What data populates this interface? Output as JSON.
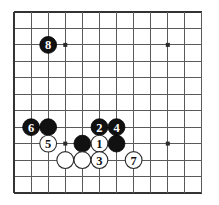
{
  "board": {
    "title": "Go board diagram",
    "background_color": "#ffffff",
    "line_color": "#5a5a5a",
    "edge_color": "#333333",
    "black_color": "#111111",
    "white_color": "#ffffff",
    "columns": 12,
    "rows": 12,
    "origin_x": 14,
    "origin_y": 12,
    "spacing_x": 17.09,
    "spacing_y": 16.45,
    "star_points": [
      {
        "col": 3,
        "row": 2
      },
      {
        "col": 9,
        "row": 2
      },
      {
        "col": 3,
        "row": 8
      },
      {
        "col": 9,
        "row": 8
      }
    ],
    "stones": [
      {
        "col": 2,
        "row": 2,
        "color": "black",
        "label": "8",
        "name": "stone-black-8"
      },
      {
        "col": 5,
        "row": 7,
        "color": "black",
        "label": "2",
        "name": "stone-black-2"
      },
      {
        "col": 6,
        "row": 7,
        "color": "black",
        "label": "4",
        "name": "stone-black-4"
      },
      {
        "col": 1,
        "row": 7,
        "color": "black",
        "label": "6",
        "name": "stone-black-6"
      },
      {
        "col": 2,
        "row": 7,
        "color": "black",
        "label": "",
        "name": "stone-black-plain-a"
      },
      {
        "col": 4,
        "row": 8,
        "color": "black",
        "label": "",
        "name": "stone-black-plain-b"
      },
      {
        "col": 6,
        "row": 8,
        "color": "black",
        "label": "",
        "name": "stone-black-plain-c"
      },
      {
        "col": 2,
        "row": 8,
        "color": "white",
        "label": "5",
        "name": "stone-white-5"
      },
      {
        "col": 5,
        "row": 8,
        "color": "white",
        "label": "1",
        "name": "stone-white-1"
      },
      {
        "col": 5,
        "row": 9,
        "color": "white",
        "label": "3",
        "name": "stone-white-3"
      },
      {
        "col": 7,
        "row": 9,
        "color": "white",
        "label": "7",
        "name": "stone-white-7"
      },
      {
        "col": 3,
        "row": 9,
        "color": "white",
        "label": "",
        "name": "stone-white-plain-a"
      },
      {
        "col": 4,
        "row": 9,
        "color": "white",
        "label": "",
        "name": "stone-white-plain-b"
      }
    ]
  }
}
